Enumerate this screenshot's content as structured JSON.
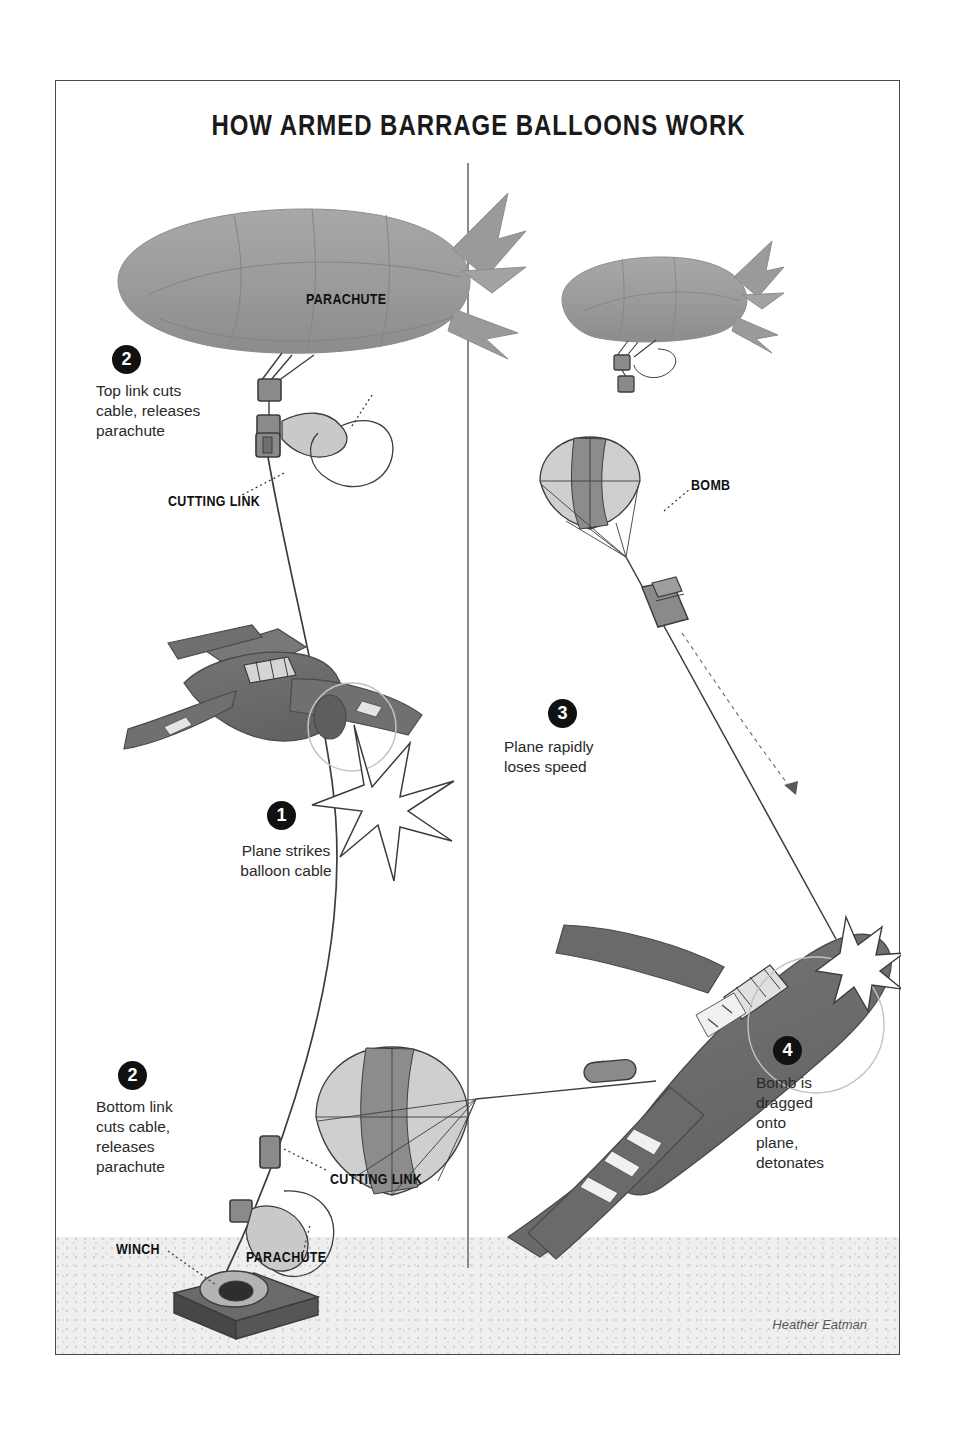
{
  "title": "HOW ARMED BARRAGE BALLOONS WORK",
  "credit": "Heather Eatman",
  "colors": {
    "balloon_fill": "#9a9a9a",
    "plane_fill": "#6d6d6d",
    "plane_dark": "#5a5a5a",
    "badge_bg": "#111111",
    "badge_text": "#ffffff",
    "line": "#3c3c3c",
    "ground": "#efefef",
    "border": "#4a4a4a",
    "divider": "#8a8a8a",
    "parachute_light": "#cfcfcf",
    "parachute_dark": "#808080",
    "text": "#2a2a2a"
  },
  "steps": [
    {
      "number": "2",
      "text": "Top link cuts\ncable, releases\nparachute",
      "panel": "left",
      "name": "step-2-top"
    },
    {
      "number": "1",
      "text": "Plane strikes\nballoon cable",
      "panel": "left",
      "name": "step-1"
    },
    {
      "number": "2",
      "text": "Bottom link\ncuts cable,\nreleases\nparachute",
      "panel": "left",
      "name": "step-2-bottom"
    },
    {
      "number": "3",
      "text": "Plane rapidly\nloses speed",
      "panel": "right",
      "name": "step-3"
    },
    {
      "number": "4",
      "text": "Bomb is\ndragged\nonto\nplane,\ndetonates",
      "panel": "right",
      "name": "step-4"
    }
  ],
  "callouts": [
    {
      "label": "PARACHUTE",
      "name": "callout-parachute-top",
      "panel": "left"
    },
    {
      "label": "CUTTING LINK",
      "name": "callout-cutting-link-top",
      "panel": "left"
    },
    {
      "label": "CUTTING LINK",
      "name": "callout-cutting-link-bottom",
      "panel": "left"
    },
    {
      "label": "PARACHUTE",
      "name": "callout-parachute-bottom",
      "panel": "left"
    },
    {
      "label": "WINCH",
      "name": "callout-winch",
      "panel": "left"
    },
    {
      "label": "BOMB",
      "name": "callout-bomb",
      "panel": "right"
    }
  ],
  "figures": {
    "balloon_large": "barrage-balloon-large",
    "balloon_small": "barrage-balloon-small",
    "plane_left": "fighter-plane-striking-cable",
    "plane_right": "fighter-plane-with-bomb",
    "parachute_left_top": "parachute-stowed-top",
    "parachute_left_bottom": "parachute-stowed-bottom",
    "parachute_right_upper": "parachute-deployed-upper",
    "parachute_right_lower": "parachute-deployed-lower",
    "bomb": "bomb-on-cable",
    "winch": "ground-winch",
    "impact_star": "impact-burst",
    "explosion_star": "detonation-burst",
    "cable": "balloon-cable"
  }
}
